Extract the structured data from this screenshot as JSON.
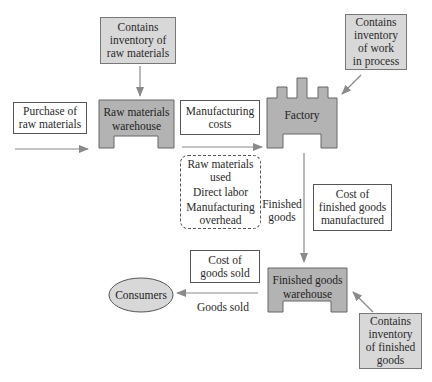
{
  "diagram": {
    "type": "flow",
    "nodes": {
      "inv_raw": {
        "label": "Contains inventory of raw materials",
        "lines": [
          "Contains",
          "inventory of",
          "raw materials"
        ]
      },
      "purchase": {
        "label": "Purchase of raw materials",
        "lines": [
          "Purchase of",
          "raw materials"
        ]
      },
      "raw_warehouse": {
        "label": "Raw materials warehouse",
        "lines": [
          "Raw materials",
          "warehouse"
        ]
      },
      "mfg_costs": {
        "label": "Manufacturing costs",
        "lines": [
          "Manufacturing",
          "costs"
        ]
      },
      "factory": {
        "label": "Factory"
      },
      "inv_wip": {
        "label": "Contains inventory of work in process",
        "lines": [
          "Contains",
          "inventory",
          "of work",
          "in process"
        ]
      },
      "mfg_components": {
        "lines": [
          "Raw materials",
          "used",
          "Direct labor",
          "Manufacturing",
          "overhead"
        ]
      },
      "finished_goods_label": {
        "lines": [
          "Finished",
          "goods"
        ]
      },
      "cost_fg_mfg": {
        "label": "Cost of finished goods manufactured",
        "lines": [
          "Cost of",
          "finished goods",
          "manufactured"
        ]
      },
      "cogs": {
        "label": "Cost of goods sold",
        "lines": [
          "Cost of",
          "goods sold"
        ]
      },
      "consumers": {
        "label": "Consumers"
      },
      "goods_sold_label": {
        "label": "Goods sold"
      },
      "fg_warehouse": {
        "label": "Finished goods warehouse",
        "lines": [
          "Finished goods",
          "warehouse"
        ]
      },
      "inv_fg": {
        "label": "Contains inventory of finished goods",
        "lines": [
          "Contains",
          "inventory",
          "of finished",
          "goods"
        ]
      }
    },
    "edges": [
      {
        "from": "inv_raw",
        "to": "raw_warehouse"
      },
      {
        "from": "purchase",
        "to": "raw_warehouse"
      },
      {
        "from": "raw_warehouse",
        "to": "factory",
        "label": "Manufacturing costs"
      },
      {
        "from": "inv_wip",
        "to": "factory"
      },
      {
        "from": "factory",
        "to": "fg_warehouse",
        "label": "Finished goods"
      },
      {
        "from": "inv_fg",
        "to": "fg_warehouse"
      },
      {
        "from": "fg_warehouse",
        "to": "consumers",
        "label": "Goods sold"
      }
    ],
    "colors": {
      "shape_fill": "#b3b3b3",
      "note_fill": "#d8d8d8",
      "arrow": "#8a8a8a",
      "stroke": "#555555"
    }
  }
}
